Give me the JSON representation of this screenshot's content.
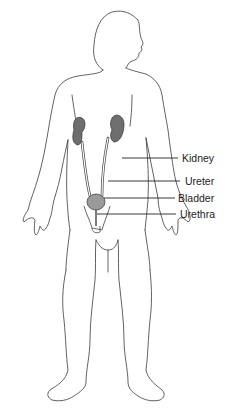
{
  "diagram": {
    "labels": [
      {
        "id": "kidney",
        "text": "Kidney",
        "x": 182,
        "y": 153
      },
      {
        "id": "ureter",
        "text": "Ureter",
        "x": 185,
        "y": 178
      },
      {
        "id": "bladder",
        "text": "Bladder",
        "x": 178,
        "y": 195
      },
      {
        "id": "urethra",
        "text": "Urethra",
        "x": 180,
        "y": 211
      }
    ],
    "colors": {
      "outline": "#3a3a3a",
      "organ_fill": "#6e6e6e",
      "bladder_fill": "#9a9a9a",
      "leader_line": "#222222"
    }
  }
}
